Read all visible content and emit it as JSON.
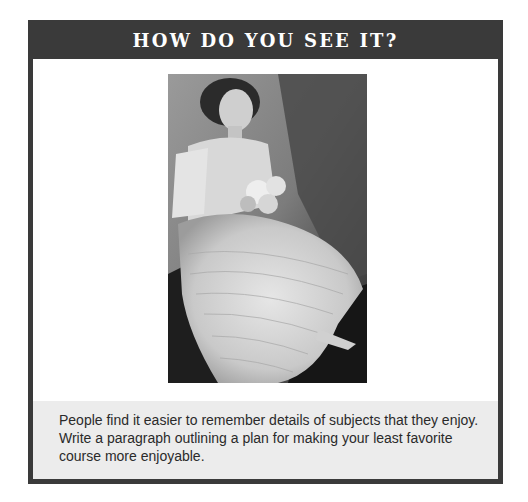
{
  "feature": {
    "title": "HOW DO YOU SEE IT?",
    "photo": {
      "icon": "vintage-portrait-photo",
      "description": "Black-and-white vintage portrait of a seated woman in a white ruffled dress holding a bouquet of roses"
    },
    "prompt": "People find it easier to remember details of subjects that they enjoy. Write a paragraph outlining a plan for making your least favorite course more enjoyable."
  },
  "colors": {
    "header_bg": "#3a3a3a",
    "header_text": "#ffffff",
    "panel_bg": "#ececec",
    "body_text": "#2a2a2a",
    "border": "#3a3a3a"
  }
}
